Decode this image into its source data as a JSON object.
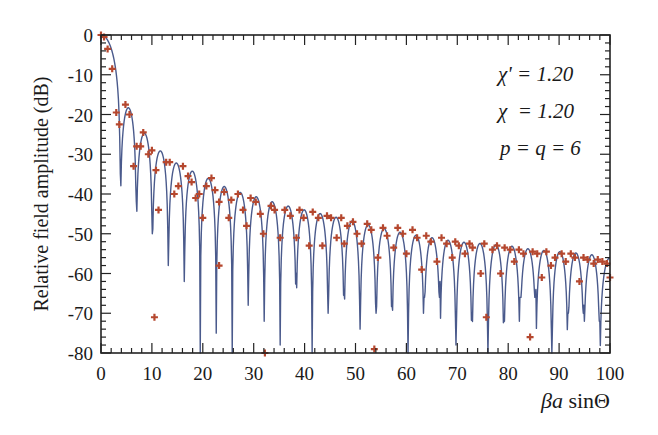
{
  "chart_data": {
    "type": "line",
    "title": "",
    "xlabel": "βa sinΘ",
    "ylabel": "Relative field amplitude (dB)",
    "xlim": [
      0,
      100
    ],
    "ylim": [
      -80,
      0
    ],
    "x_ticks": [
      0,
      10,
      20,
      30,
      40,
      50,
      60,
      70,
      80,
      90,
      100
    ],
    "x_tick_labels": [
      "0",
      "10",
      "20",
      "30",
      "40",
      "50",
      "60",
      "70",
      "80",
      "90",
      "100"
    ],
    "y_ticks": [
      0,
      -10,
      -20,
      -30,
      -40,
      -50,
      -60,
      -70,
      -80
    ],
    "y_tick_labels": [
      "0",
      "-10",
      "-20",
      "-30",
      "-40",
      "-50",
      "-60",
      "-70",
      "-80"
    ],
    "grid": false,
    "legend": null,
    "annotations": [
      "χ' = 1.20",
      "χ = 1.20",
      "p = q = 6"
    ],
    "series": [
      {
        "name": "computed pattern (line)",
        "style": "line",
        "color": "#4a5a8c",
        "first_null": 3.8,
        "null_spacing": 3.14,
        "peak_envelope": {
          "x": [
            0,
            5,
            8,
            11.5,
            14.5,
            17.5,
            21,
            24,
            27,
            30,
            35,
            40,
            45,
            50,
            55,
            60,
            65,
            70,
            75,
            80,
            85,
            90,
            95,
            100
          ],
          "y": [
            0,
            -17.5,
            -24,
            -29,
            -32,
            -34,
            -36,
            -38,
            -39.5,
            -40.5,
            -42.5,
            -44,
            -45.5,
            -47,
            -48.5,
            -50,
            -51,
            -52,
            -52.5,
            -53,
            -54,
            -54.5,
            -55,
            -56
          ]
        },
        "null_depth_dB": [
          -35,
          -42,
          -50,
          -58,
          -62,
          -80,
          -75,
          -80,
          -68,
          -72,
          -78,
          -60,
          -80,
          -70,
          -65,
          -74,
          -70,
          -68,
          -80,
          -66,
          -62,
          -78,
          -70,
          -80,
          -72,
          -66,
          -64,
          -80,
          -70,
          -68,
          -72,
          -62
        ]
      },
      {
        "name": "measured (markers)",
        "style": "marker",
        "marker": "+",
        "color": "#b5472e",
        "points": [
          [
            0,
            0
          ],
          [
            0.6,
            -0.5
          ],
          [
            1.3,
            -3.5
          ],
          [
            2.2,
            -8.5
          ],
          [
            3.0,
            -19.5
          ],
          [
            3.6,
            -22.5
          ],
          [
            4.8,
            -17.5
          ],
          [
            5.6,
            -20
          ],
          [
            6.4,
            -33
          ],
          [
            7.0,
            -28
          ],
          [
            7.8,
            -28
          ],
          [
            8.3,
            -24.5
          ],
          [
            9.3,
            -30
          ],
          [
            10.0,
            -29
          ],
          [
            10.8,
            -34
          ],
          [
            10.5,
            -71
          ],
          [
            11.3,
            -44
          ],
          [
            12.8,
            -32
          ],
          [
            13.5,
            -32
          ],
          [
            14.4,
            -40
          ],
          [
            15.2,
            -38
          ],
          [
            16.1,
            -33
          ],
          [
            17.1,
            -35.5
          ],
          [
            17.8,
            -37
          ],
          [
            18.6,
            -41
          ],
          [
            19.3,
            -40
          ],
          [
            20.0,
            -46
          ],
          [
            20.7,
            -38
          ],
          [
            21.7,
            -36
          ],
          [
            22.4,
            -39
          ],
          [
            23.2,
            -42
          ],
          [
            23.2,
            -58
          ],
          [
            24.2,
            -39.5
          ],
          [
            25.1,
            -46
          ],
          [
            25.6,
            -41.5
          ],
          [
            26.9,
            -40
          ],
          [
            27.9,
            -44
          ],
          [
            28.6,
            -48
          ],
          [
            29.4,
            -41
          ],
          [
            30.4,
            -42
          ],
          [
            31.3,
            -45
          ],
          [
            31.9,
            -50
          ],
          [
            32.2,
            -80
          ],
          [
            33.4,
            -43
          ],
          [
            34.1,
            -44
          ],
          [
            35.2,
            -51
          ],
          [
            36.1,
            -44
          ],
          [
            37.2,
            -45.5
          ],
          [
            38.4,
            -51
          ],
          [
            39.0,
            -44
          ],
          [
            39.8,
            -46
          ],
          [
            40.9,
            -53
          ],
          [
            41.6,
            -44.5
          ],
          [
            42.7,
            -46
          ],
          [
            43.5,
            -53
          ],
          [
            44.4,
            -45.5
          ],
          [
            45.2,
            -46
          ],
          [
            46.3,
            -51
          ],
          [
            47.2,
            -46
          ],
          [
            47.8,
            -52.5
          ],
          [
            48.4,
            -48
          ],
          [
            49.5,
            -47
          ],
          [
            50.3,
            -50
          ],
          [
            51.2,
            -52.5
          ],
          [
            52.3,
            -47.5
          ],
          [
            53.1,
            -49
          ],
          [
            53.7,
            -79
          ],
          [
            54.4,
            -56
          ],
          [
            55.4,
            -48.5
          ],
          [
            56.2,
            -50.5
          ],
          [
            57.5,
            -53.5
          ],
          [
            58.3,
            -48.5
          ],
          [
            59.3,
            -50
          ],
          [
            60.0,
            -55
          ],
          [
            61.2,
            -49
          ],
          [
            62.1,
            -51
          ],
          [
            63.0,
            -59
          ],
          [
            63.9,
            -50.5
          ],
          [
            64.8,
            -52
          ],
          [
            66.0,
            -57
          ],
          [
            66.9,
            -51
          ],
          [
            67.9,
            -52.5
          ],
          [
            69.0,
            -56
          ],
          [
            69.6,
            -52
          ],
          [
            70.3,
            -53
          ],
          [
            71.5,
            -55
          ],
          [
            72.4,
            -52.5
          ],
          [
            73.0,
            -53.5
          ],
          [
            74.6,
            -60
          ],
          [
            75.3,
            -52.5
          ],
          [
            75.7,
            -71
          ],
          [
            76.9,
            -54
          ],
          [
            77.8,
            -53
          ],
          [
            78.5,
            -60
          ],
          [
            79.3,
            -53.5
          ],
          [
            80.4,
            -54
          ],
          [
            81.2,
            -57
          ],
          [
            82.1,
            -54
          ],
          [
            83.0,
            -55
          ],
          [
            84.3,
            -76
          ],
          [
            84.8,
            -54.5
          ],
          [
            85.7,
            -55
          ],
          [
            86.6,
            -61
          ],
          [
            87.5,
            -54.5
          ],
          [
            88.4,
            -58
          ],
          [
            89.2,
            -56
          ],
          [
            90.5,
            -55
          ],
          [
            91.3,
            -57
          ],
          [
            92.3,
            -55
          ],
          [
            93.1,
            -56
          ],
          [
            94.0,
            -62
          ],
          [
            94.8,
            -56
          ],
          [
            95.6,
            -56.5
          ],
          [
            96.8,
            -57.5
          ],
          [
            97.6,
            -56.5
          ],
          [
            98.5,
            -57
          ],
          [
            99.4,
            -57.5
          ],
          [
            100.0,
            -61
          ]
        ]
      }
    ],
    "frame": {
      "left_px": 101,
      "right_px": 610,
      "top_px": 35,
      "bottom_px": 353
    }
  },
  "labels": {
    "xlabel_beta": "β",
    "xlabel_a": "a",
    "xlabel_rest": " sinΘ",
    "ylabel": "Relative field amplitude (dB)",
    "annot_chi_prime": "χ' = 1.20",
    "annot_chi": "χ  = 1.20",
    "annot_pq": "p = q = 6"
  }
}
